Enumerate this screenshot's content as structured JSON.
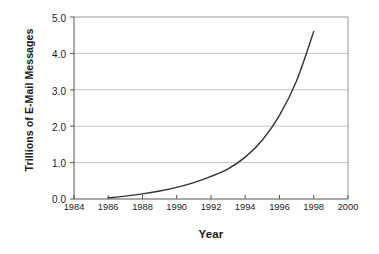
{
  "chart_data": {
    "type": "line",
    "title": "",
    "xlabel": "Year",
    "ylabel": "Trillions of E-Mail Messages",
    "xlim": [
      1984,
      2000
    ],
    "ylim": [
      0.0,
      5.0
    ],
    "xticks": [
      "1984",
      "1986",
      "1988",
      "1990",
      "1992",
      "1994",
      "1996",
      "1998",
      "2000"
    ],
    "yticks": [
      "0.0",
      "1.0",
      "2.0",
      "3.0",
      "4.0",
      "5.0"
    ],
    "grid": "horizontal",
    "legend": null,
    "series": [
      {
        "name": "E-Mail Messages",
        "color": "#333333",
        "x": [
          1986,
          1987,
          1988,
          1989,
          1990,
          1991,
          1992,
          1993,
          1994,
          1995,
          1996,
          1997,
          1998
        ],
        "values": [
          0.03,
          0.08,
          0.14,
          0.22,
          0.32,
          0.45,
          0.62,
          0.83,
          1.15,
          1.62,
          2.3,
          3.25,
          4.6
        ]
      }
    ]
  },
  "axis": {
    "y_title": "Trillions of E-Mail Messages",
    "x_title": "Year",
    "y_tick_labels": [
      "5.0",
      "4.0",
      "3.0",
      "2.0",
      "1.0",
      "0.0"
    ],
    "x_tick_labels": [
      "1984",
      "1986",
      "1988",
      "1990",
      "1992",
      "1994",
      "1996",
      "1998",
      "2000"
    ]
  },
  "colors": {
    "line": "#333333",
    "grid": "#c4c4c4",
    "frame": "#8c8c8c",
    "text": "#1a1a1a",
    "background": "#ffffff"
  }
}
